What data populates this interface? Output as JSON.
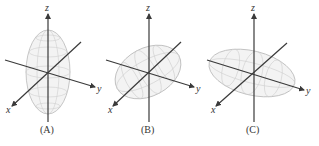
{
  "figure": {
    "panels": [
      {
        "id": "A",
        "caption": "(A)",
        "description": "Ellipsoid elongated along z-axis",
        "axes": {
          "x": "x",
          "y": "y",
          "z": "z"
        }
      },
      {
        "id": "B",
        "caption": "(B)",
        "description": "Ellipsoid elongated along x-axis (tilted)",
        "axes": {
          "x": "x",
          "y": "y",
          "z": "z"
        }
      },
      {
        "id": "C",
        "caption": "(C)",
        "description": "Ellipsoid elongated along y-axis",
        "axes": {
          "x": "x",
          "y": "y",
          "z": "z"
        }
      }
    ],
    "colors": {
      "axis": "#3a3a3a",
      "surface_fill": "#f3f3f3",
      "surface_stroke": "#b9b9b9",
      "mesh": "#cfcfcf",
      "text": "#333333"
    }
  }
}
